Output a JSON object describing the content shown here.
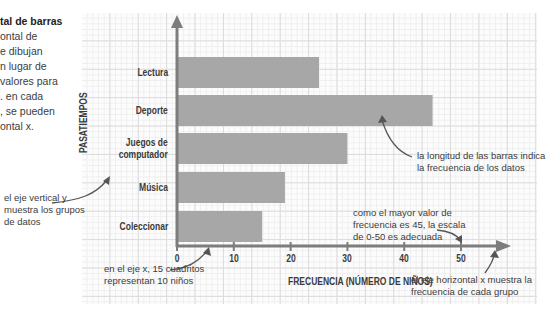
{
  "sidebar_text": {
    "title": "tal de barras",
    "lines": [
      "ontal de",
      "e dibujan",
      "n lugar de",
      "valores para",
      ". en cada",
      ", se pueden",
      "ontal x."
    ]
  },
  "notes": {
    "y_axis": [
      "el eje vertical y",
      "muestra los grupos",
      "de datos"
    ],
    "scale": [
      "en el eje x, 15 cuadritos",
      "representan 10 niños"
    ],
    "bar_length": [
      "la longitud de las barras indica",
      "la frecuencia de los datos"
    ],
    "max_value": [
      "como el mayor valor de",
      "frecuencia es 45, la escala",
      "de 0-50 es adecuada"
    ],
    "x_axis": [
      "el eje horizontal x muestra la",
      "frecuencia de cada grupo"
    ]
  },
  "colors": {
    "bar": "#a7a7a7",
    "axis": "#7d7d7d",
    "arrow": "#555555"
  },
  "chart_data": {
    "type": "bar",
    "orientation": "horizontal",
    "title": "",
    "xlabel": "FRECUENCIA (NÚMERO DE NIÑOS)",
    "ylabel": "PASATIEMPOS",
    "categories": [
      "Lectura",
      "Deporte",
      "Juegos de computador",
      "Música",
      "Coleccionar"
    ],
    "category_lines": [
      [
        "Lectura"
      ],
      [
        "Deporte"
      ],
      [
        "Juegos de",
        "computador"
      ],
      [
        "Música"
      ],
      [
        "Coleccionar"
      ]
    ],
    "values": [
      25,
      45,
      30,
      19,
      15
    ],
    "xlim": [
      0,
      50
    ],
    "xticks": [
      "0",
      "10",
      "20",
      "30",
      "40",
      "50"
    ],
    "grid": true,
    "legend": null
  }
}
